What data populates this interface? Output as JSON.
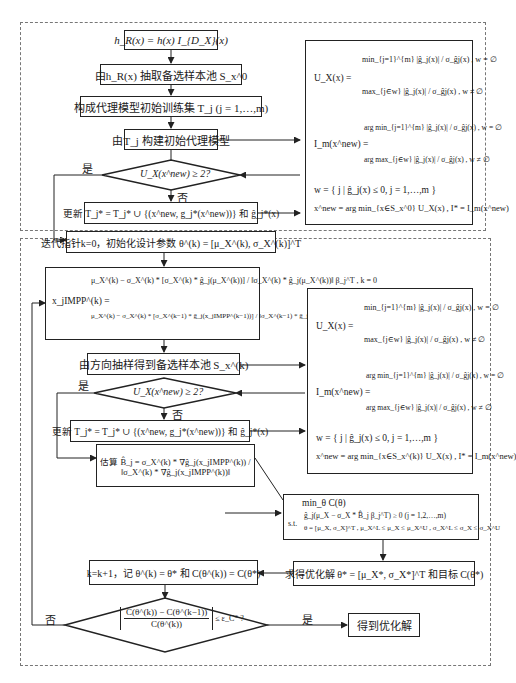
{
  "stage1": {
    "box_hR": "h_R(x) = h(x) I_{D_X}(x)",
    "box_sample_pool": "由h_R(x) 抽取备选样本池 S_x^0",
    "box_training_set": "构成代理模型初始训练集 T_j (j = 1,…,m)",
    "box_build_model": "由T_j 构建初始代理模型",
    "decision": "U_X(x^new) ≥ 2?",
    "yes_label": "是",
    "no_label": "否",
    "box_update": "更新 T_j* = T_j* ∪ {(x^new, g_j*(x^new))} 和 ĝ_j*(x)",
    "side_panel": {
      "ux_label": "U_X(x) =",
      "ux_case1": "min_{j=1}^{m} |ĝ_j(x)| / σ_ĝj(x) ,  w = ∅",
      "ux_case2": "max_{j∈w} |ĝ_j(x)| / σ_ĝj(x) ,  w ≠ ∅",
      "im_label": "I_m(x^new) =",
      "im_case1": "arg min_{j=1}^{m} |ĝ_j(x)| / σ_ĝj(x) ,  w = ∅",
      "im_case2": "arg max_{j∈w} |ĝ_j(x)| / σ_ĝj(x) ,  w ≠ ∅",
      "w_def": "w = { j | ĝ_j(x) ≤ 0, j = 1,…,m }",
      "xnew_def": "x^new = arg min_{x∈S_x^0} U_X(x) ,   I* = I_m(x^new)"
    }
  },
  "stage2": {
    "box_init": "迭代指针k=0，初始化设计参数 θ^(k) = [μ_X^(k), σ_X^(k)]^T",
    "mpp": {
      "lhs": "x_jIMPP^(k) =",
      "case1": "μ_X^(k) − σ_X^(k) * [σ_X^(k) * ĝ_j(μ_X^(k))] / ‖σ_X^(k) * ĝ_j(μ_X^(k))‖ β_j^T ,  k = 0",
      "case2": "μ_X^(k) − σ_X^(k) * [σ_X^(k−1) * ĝ_j(x_jIMPP^(k−1))] / ‖σ_X^(k−1) * ĝ_j(x_jIMPP^(k−1))‖ β_j^T ,  k = 1,2,…,opt",
      "k0": "k = 0",
      "kn": "k = 1,2,…,opt"
    },
    "box_directional": "由方向抽样得到备选样本池 S_x^(k)",
    "decision": "U_X(x^new) ≥ 2?",
    "yes_label": "是",
    "no_label": "否",
    "box_update": "更新 T_j* = T_j* ∪ {(x^new, g_j*(x^new))} 和 ĝ_j*(x)",
    "box_estimate": "估算 B̂_j = σ_X^(k) * ∇ĝ_j(x_jIMPP^(k)) / ‖σ_X^(k) * ∇ĝ_j(x_jIMPP^(k))‖",
    "estimate_prefix": "估算",
    "side_panel": {
      "ux_label": "U_X(x) =",
      "ux_case1": "min_{j=1}^{m} |ĝ_j(x)| / σ_ĝj(x) ,  w = ∅",
      "ux_case2": "max_{j∈w} |ĝ_j(x)| / σ_ĝj(x) ,  w ≠ ∅",
      "im_label": "I_m(x^new) =",
      "im_case1": "arg min_{j=1}^{m} |ĝ_j(x)| / σ_ĝj(x) ,  w = ∅",
      "im_case2": "arg max_{j∈w} |ĝ_j(x)| / σ_ĝj(x) ,  w ≠ ∅",
      "w_def": "w = { j | ĝ_j(x) ≤ 0, j = 1,…,m }",
      "xnew_def": "x^new = arg min_{x∈S_x^(k)} U_X(x) ,   I* = I_m(x^new)"
    },
    "opt_problem": {
      "objective": "min_θ C(θ)",
      "st_label": "s.t.",
      "constraint1": "ĝ_j(μ_X − σ_X * B̂_j β_j^T) ≥ 0     (j = 1,2,…,m)",
      "constraint2": "θ = [μ_X, σ_X]^T , μ_X^L ≤ μ_X ≤ μ_X^U , σ_X^L ≤ σ_X ≤ σ_X^U"
    },
    "box_solution": "求得优化解 θ* = [μ_X*, σ_X*]^T 和目标 C(θ*)",
    "box_record": "k=k+1，记 θ^(k) = θ* 和 C(θ^(k)) = C(θ*)",
    "convergence": {
      "numerator": "C(θ^(k)) − C(θ^(k−1))",
      "denominator": "C(θ^(k))",
      "threshold": "≤ ε_C* ?"
    },
    "box_result": "得到优化解"
  }
}
